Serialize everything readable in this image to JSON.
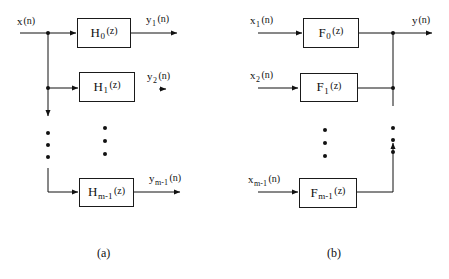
{
  "figure": {
    "ink_color": "#111111",
    "background": "#ffffff"
  },
  "panel_a": {
    "caption": "(a)",
    "input_label": {
      "base": "x",
      "sub": "",
      "arg": "(n)"
    },
    "blocks": [
      {
        "name": "H",
        "sub": "0",
        "arg": "(z)"
      },
      {
        "name": "H",
        "sub": "1",
        "arg": "(z)"
      },
      {
        "name": "H",
        "sub": "m-1",
        "arg": "(z)"
      }
    ],
    "outputs": [
      {
        "base": "y",
        "sub": "1",
        "arg": "(n)"
      },
      {
        "base": "y",
        "sub": "2",
        "arg": "(n)"
      },
      {
        "base": "y",
        "sub": "m-1",
        "arg": "(n)"
      }
    ],
    "vertical_ellipsis_count": 3
  },
  "panel_b": {
    "caption": "(b)",
    "inputs": [
      {
        "base": "x",
        "sub": "1",
        "arg": "(n)"
      },
      {
        "base": "x",
        "sub": "2",
        "arg": "(n)"
      },
      {
        "base": "x",
        "sub": "m-1",
        "arg": "(n)"
      }
    ],
    "blocks": [
      {
        "name": "F",
        "sub": "0",
        "arg": "(z)"
      },
      {
        "name": "F",
        "sub": "1",
        "arg": "(z)"
      },
      {
        "name": "F",
        "sub": "m-1",
        "arg": "(z)"
      }
    ],
    "output_label": {
      "base": "y",
      "sub": "",
      "arg": "(n)"
    },
    "vertical_ellipsis_count": 3
  }
}
